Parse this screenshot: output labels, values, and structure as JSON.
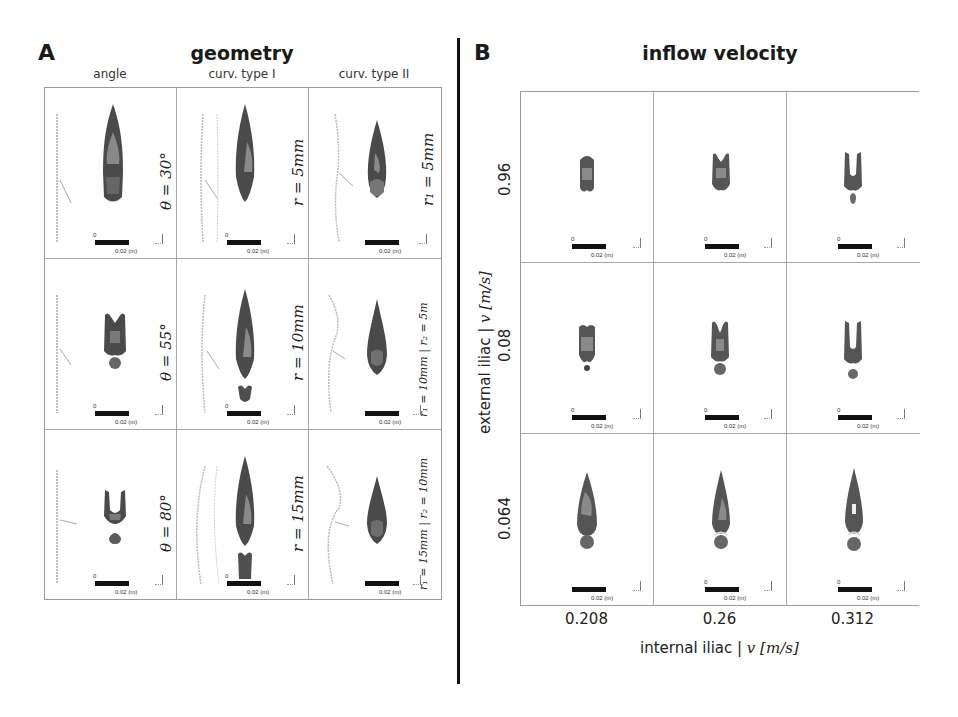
{
  "figure": {
    "panel_a": {
      "letter": "A",
      "title": "geometry",
      "columns": [
        "angle",
        "curv. type I",
        "curv. type II"
      ],
      "rows": [
        {
          "cells": [
            {
              "label": "θ = 30°",
              "shape": "long-cone"
            },
            {
              "label": "r = 5mm",
              "shape": "long-cone"
            },
            {
              "label": "r₁ = 5mm",
              "shape": "cone-bulb"
            }
          ]
        },
        {
          "cells": [
            {
              "label": "θ = 55°",
              "shape": "split-bulb"
            },
            {
              "label": "r = 10mm",
              "shape": "long-cone-detached"
            },
            {
              "label": "r₁ = 10mm | r₂ = 5m",
              "shape": "cone-bulb"
            }
          ]
        },
        {
          "cells": [
            {
              "label": "θ = 80°",
              "shape": "u-split"
            },
            {
              "label": "r = 15mm",
              "shape": "long-cone-detached"
            },
            {
              "label": "r₁ = 15mm | r₂ = 10mm",
              "shape": "cone-bulb"
            }
          ]
        }
      ]
    },
    "panel_b": {
      "letter": "B",
      "title": "inflow velocity",
      "row_values": [
        "0.96",
        "0.08",
        "0.064"
      ],
      "col_values": [
        "0.208",
        "0.26",
        "0.312"
      ],
      "y_axis_title_text": "external iliac | ",
      "y_axis_title_math": "v [m/s]",
      "x_axis_title_text": "internal iliac | ",
      "x_axis_title_math": "v [m/s]"
    },
    "scale_bar": {
      "zero": "0",
      "label": "0.02  (m)"
    },
    "colors": {
      "divider": "#111111",
      "grid_border": "#9a9a9a",
      "plume_dark": "#3a3a3a",
      "plume_mid": "#707070",
      "plume_light": "#a8a8a8"
    }
  }
}
